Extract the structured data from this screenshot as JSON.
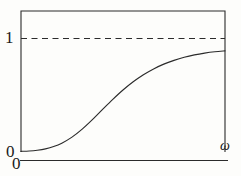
{
  "figure": {
    "background_color": "#fdfdfb",
    "ink_color": "#2b2b2b"
  },
  "labels": {
    "y_one": "1",
    "y_zero": "0",
    "x_zero": "0",
    "x_axis_symbol": "ω"
  },
  "chart_data": {
    "type": "line",
    "title": "",
    "subtitle": "",
    "xlabel": "ω",
    "ylabel": "",
    "xlim": [
      0,
      1
    ],
    "ylim": [
      0,
      1.12
    ],
    "grid": false,
    "legend": null,
    "x_tick_labels": [
      "0"
    ],
    "y_tick_labels": [
      "0",
      "1"
    ],
    "y_ticks": [
      0,
      1
    ],
    "annotations": [
      {
        "name": "asymptote",
        "type": "horizontal-dashed-line",
        "y": 1,
        "label": "1",
        "style": "dashed",
        "color": "#2b2b2b"
      }
    ],
    "series": [
      {
        "name": "response-curve",
        "style": "solid",
        "color": "#2b2b2b",
        "x": [
          0.0,
          0.04,
          0.08,
          0.12,
          0.16,
          0.2,
          0.25,
          0.3,
          0.35,
          0.4,
          0.45,
          0.5,
          0.55,
          0.6,
          0.65,
          0.7,
          0.75,
          0.8,
          0.85,
          0.9,
          0.95,
          1.0
        ],
        "y": [
          0.01,
          0.013,
          0.02,
          0.032,
          0.052,
          0.082,
          0.135,
          0.205,
          0.288,
          0.378,
          0.466,
          0.548,
          0.62,
          0.682,
          0.733,
          0.775,
          0.808,
          0.835,
          0.856,
          0.872,
          0.884,
          0.892
        ]
      }
    ]
  }
}
